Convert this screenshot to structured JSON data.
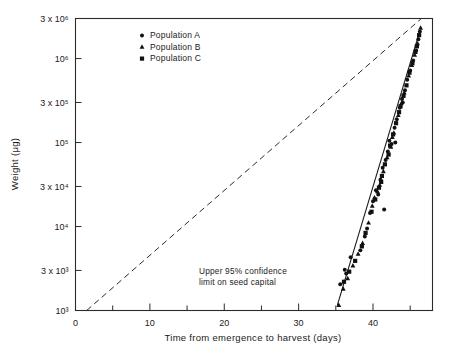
{
  "chart_data": {
    "type": "scatter",
    "title": "",
    "xlabel": "Time from emergence to harvest (days)",
    "ylabel": "Weight (μg)",
    "xlim": [
      0,
      48
    ],
    "ylim": [
      1000,
      3000000
    ],
    "yscale": "log",
    "grid": false,
    "legend_position": "top-left-inside",
    "x_ticks_major": [
      0,
      10,
      20,
      30,
      40
    ],
    "x_tick_labels": [
      "0",
      "10",
      "20",
      "30",
      "40"
    ],
    "x_ticks_minor": [
      5,
      15,
      25,
      35,
      45
    ],
    "y_ticks": [
      1000,
      3000,
      10000,
      30000,
      100000,
      300000,
      1000000,
      3000000
    ],
    "y_tick_labels": [
      "10³",
      "3 x 10³",
      "10⁴",
      "3 x 10⁴",
      "10⁵",
      "3 x 10⁵",
      "10⁶",
      "3 x 10⁶"
    ],
    "annotations": [
      {
        "name": "confidence-limit-note",
        "line1": "Upper 95% confidence",
        "line2": "limit on seed capital",
        "value": 1000,
        "x_start": 33.0,
        "x_end": 40.0
      }
    ],
    "reference_line": {
      "name": "diagonal-dashed-reference",
      "style": "dashed",
      "x": [
        1.5,
        46.5
      ],
      "y": [
        1000,
        3000000
      ]
    },
    "fit_line": {
      "name": "solid-regression-fit",
      "style": "solid",
      "x": [
        35.2,
        46.2
      ],
      "y": [
        1150,
        2000000
      ]
    },
    "series": [
      {
        "name": "Population A",
        "marker": "circle",
        "color": "#111111",
        "points": [
          [
            35.6,
            2050
          ],
          [
            36.2,
            3050
          ],
          [
            36.4,
            2750
          ],
          [
            37.0,
            4300
          ],
          [
            38.3,
            5200
          ],
          [
            38.9,
            7600
          ],
          [
            39.2,
            9500
          ],
          [
            39.6,
            14500
          ],
          [
            40.0,
            20000
          ],
          [
            40.4,
            27000
          ],
          [
            40.7,
            24000
          ],
          [
            41.0,
            36000
          ],
          [
            41.3,
            50000
          ],
          [
            41.7,
            62000
          ],
          [
            42.0,
            78000
          ],
          [
            42.2,
            105000
          ],
          [
            42.5,
            96000
          ],
          [
            42.9,
            150000
          ],
          [
            43.2,
            190000
          ],
          [
            43.6,
            260000
          ],
          [
            43.9,
            330000
          ],
          [
            44.3,
            420000
          ],
          [
            44.6,
            560000
          ],
          [
            45.0,
            720000
          ],
          [
            45.4,
            950000
          ],
          [
            45.8,
            1250000
          ],
          [
            46.1,
            1700000
          ],
          [
            46.3,
            2100000
          ],
          [
            41.5,
            16000
          ],
          [
            43.0,
            100000
          ],
          [
            44.0,
            300000
          ]
        ]
      },
      {
        "name": "Population B",
        "marker": "triangle",
        "color": "#111111",
        "points": [
          [
            35.4,
            1150
          ],
          [
            36.0,
            1800
          ],
          [
            36.6,
            2400
          ],
          [
            37.3,
            3400
          ],
          [
            38.0,
            4700
          ],
          [
            38.6,
            6300
          ],
          [
            39.4,
            11000
          ],
          [
            39.9,
            17500
          ],
          [
            40.2,
            22000
          ],
          [
            40.9,
            31000
          ],
          [
            41.4,
            45000
          ],
          [
            41.9,
            66000
          ],
          [
            42.4,
            88000
          ],
          [
            42.8,
            130000
          ],
          [
            43.4,
            210000
          ],
          [
            43.8,
            290000
          ],
          [
            44.2,
            390000
          ],
          [
            44.8,
            620000
          ],
          [
            45.2,
            830000
          ],
          [
            45.6,
            1100000
          ],
          [
            46.0,
            1500000
          ],
          [
            46.4,
            2300000
          ],
          [
            40.6,
            26000
          ],
          [
            42.6,
            115000
          ]
        ]
      },
      {
        "name": "Population C",
        "marker": "square",
        "color": "#111111",
        "points": [
          [
            36.1,
            2200
          ],
          [
            36.8,
            2900
          ],
          [
            37.6,
            3900
          ],
          [
            38.5,
            5800
          ],
          [
            39.0,
            8400
          ],
          [
            39.8,
            15000
          ],
          [
            40.3,
            21000
          ],
          [
            40.8,
            29000
          ],
          [
            41.2,
            40000
          ],
          [
            41.6,
            55000
          ],
          [
            42.1,
            72000
          ],
          [
            42.3,
            92000
          ],
          [
            42.7,
            125000
          ],
          [
            43.1,
            170000
          ],
          [
            43.5,
            230000
          ],
          [
            44.1,
            360000
          ],
          [
            44.5,
            480000
          ],
          [
            44.9,
            680000
          ],
          [
            45.3,
            880000
          ],
          [
            45.7,
            1200000
          ],
          [
            46.2,
            1900000
          ],
          [
            41.1,
            34000
          ],
          [
            43.7,
            270000
          ],
          [
            45.9,
            1400000
          ]
        ]
      }
    ]
  },
  "legend": {
    "items": [
      {
        "label": "Population  A",
        "marker": "circle"
      },
      {
        "label": "Population  B",
        "marker": "triangle"
      },
      {
        "label": "Population  C",
        "marker": "square"
      }
    ]
  }
}
